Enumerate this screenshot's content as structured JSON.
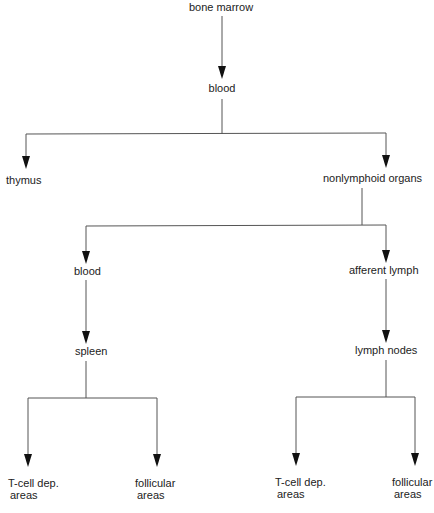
{
  "diagram": {
    "type": "flow-tree",
    "line_color": "#555555",
    "arrow_color": "#111111",
    "text_color": "#222222",
    "nodes": {
      "bone_marrow": "bone marrow",
      "blood_top": "blood",
      "thymus": "thymus",
      "nonlymphoid_organs": "nonlymphoid organs",
      "blood_left": "blood",
      "afferent_lymph": "afferent lymph",
      "spleen": "spleen",
      "lymph_nodes": "lymph nodes",
      "spleen_tcell_line1": "T-cell dep.",
      "spleen_tcell_line2": "areas",
      "spleen_follicular_line1": "follicular",
      "spleen_follicular_line2": "areas",
      "ln_tcell_line1": "T-cell dep.",
      "ln_tcell_line2": "areas",
      "ln_follicular_line1": "follicular",
      "ln_follicular_line2": "areas"
    },
    "edges": [
      {
        "from": "bone marrow",
        "to": "blood"
      },
      {
        "from": "blood",
        "to": "thymus"
      },
      {
        "from": "blood",
        "to": "nonlymphoid organs"
      },
      {
        "from": "nonlymphoid organs",
        "to": "blood"
      },
      {
        "from": "nonlymphoid organs",
        "to": "afferent lymph"
      },
      {
        "from": "blood",
        "to": "spleen"
      },
      {
        "from": "afferent lymph",
        "to": "lymph nodes"
      },
      {
        "from": "spleen",
        "to": "T-cell dep. areas"
      },
      {
        "from": "spleen",
        "to": "follicular areas"
      },
      {
        "from": "lymph nodes",
        "to": "T-cell dep. areas"
      },
      {
        "from": "lymph nodes",
        "to": "follicular areas"
      }
    ]
  }
}
